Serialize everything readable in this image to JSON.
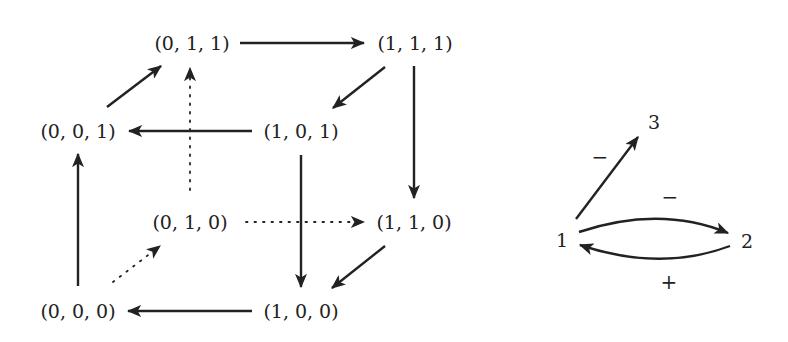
{
  "cube": {
    "nodes": {
      "n011": "(0, 1, 1)",
      "n111": "(1, 1, 1)",
      "n001": "(0, 0, 1)",
      "n101": "(1, 0, 1)",
      "n010": "(0, 1, 0)",
      "n110": "(1, 1, 0)",
      "n000": "(0, 0, 0)",
      "n100": "(1, 0, 0)"
    },
    "edges": [
      {
        "from": "(0, 1, 1)",
        "to": "(1, 1, 1)",
        "style": "solid"
      },
      {
        "from": "(1, 1, 1)",
        "to": "(1, 0, 1)",
        "style": "solid"
      },
      {
        "from": "(1, 1, 1)",
        "to": "(1, 1, 0)",
        "style": "solid"
      },
      {
        "from": "(1, 0, 1)",
        "to": "(0, 0, 1)",
        "style": "solid"
      },
      {
        "from": "(1, 0, 1)",
        "to": "(1, 0, 0)",
        "style": "solid"
      },
      {
        "from": "(0, 0, 1)",
        "to": "(0, 1, 1)",
        "style": "solid"
      },
      {
        "from": "(0, 0, 0)",
        "to": "(0, 0, 1)",
        "style": "solid"
      },
      {
        "from": "(1, 1, 0)",
        "to": "(1, 0, 0)",
        "style": "solid"
      },
      {
        "from": "(1, 0, 0)",
        "to": "(0, 0, 0)",
        "style": "solid"
      },
      {
        "from": "(0, 0, 0)",
        "to": "(0, 1, 0)",
        "style": "dotted"
      },
      {
        "from": "(0, 1, 0)",
        "to": "(0, 1, 1)",
        "style": "dotted"
      },
      {
        "from": "(0, 1, 0)",
        "to": "(1, 1, 0)",
        "style": "dotted"
      }
    ]
  },
  "interaction_graph": {
    "nodes": {
      "n1": "1",
      "n2": "2",
      "n3": "3"
    },
    "edges": [
      {
        "from": "1",
        "to": "3",
        "sign": "−"
      },
      {
        "from": "1",
        "to": "2",
        "sign": "−"
      },
      {
        "from": "2",
        "to": "1",
        "sign": "+"
      }
    ],
    "labels": {
      "e13": "−",
      "e12": "−",
      "e21": "+"
    }
  }
}
